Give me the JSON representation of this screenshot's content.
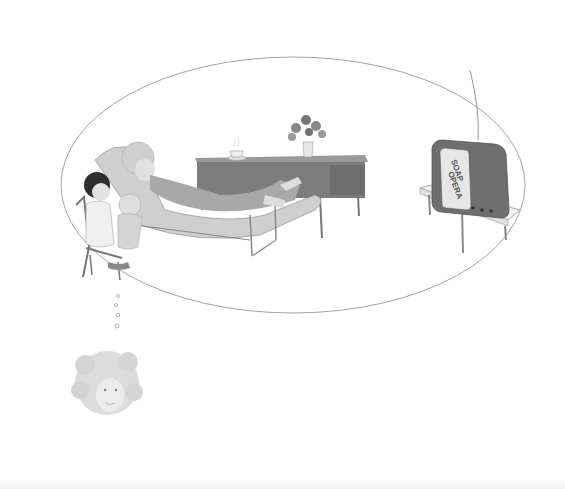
{
  "illustration": {
    "description": "Pencil and watercolor illustration of a thought bubble: a grandmother reclines on a chaise lounge beside a child holding a baby, a drop-leaf table with a teacup and vase of flowers, and a television on a small stand showing a soap opera. Below, small bubbles lead to a faded head of curly-haired woman.",
    "tv_screen_text": {
      "line1": "SOAP",
      "line2": "OPERA"
    },
    "elements": [
      "thought-bubble",
      "grandmother-on-chaise",
      "child-in-chair",
      "baby",
      "drop-leaf-table",
      "teacup",
      "flower-vase",
      "television",
      "tv-stand",
      "thought-trail-bubbles",
      "dreamer-head"
    ],
    "colors": {
      "line": "#8a8a8a",
      "tv_body": "#6f6f6f",
      "tv_screen": "#e6e6e6",
      "table": "#7c7c7c",
      "chaise_plaid": "#c9c9c9",
      "hair": "#cfcfcf",
      "skin": "#d8d8d8",
      "child_hair": "#2e2e2e"
    }
  }
}
